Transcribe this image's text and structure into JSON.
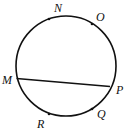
{
  "diagram": {
    "type": "circle-with-chord",
    "stroke_color": "#111111",
    "circle": {
      "cx": 66,
      "cy": 66,
      "r": 50
    },
    "chord": {
      "from": "M",
      "to": "P"
    },
    "points": [
      {
        "name": "N",
        "label": "N"
      },
      {
        "name": "O",
        "label": "O"
      },
      {
        "name": "M",
        "label": "M"
      },
      {
        "name": "P",
        "label": "P"
      },
      {
        "name": "Q",
        "label": "Q"
      },
      {
        "name": "R",
        "label": "R"
      }
    ]
  }
}
